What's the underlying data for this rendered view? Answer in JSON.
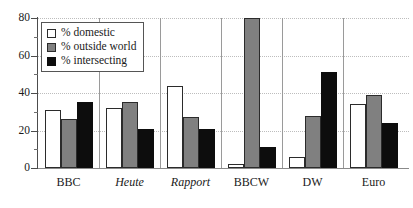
{
  "chart_data": {
    "type": "bar",
    "title": "",
    "xlabel": "",
    "ylabel": "",
    "ylim": [
      0,
      80
    ],
    "yticks": [
      0,
      20,
      40,
      60,
      80
    ],
    "ytick_labels": [
      "0",
      "20",
      "40",
      "60",
      "80"
    ],
    "minor_yticks": [
      10,
      30,
      50,
      70
    ],
    "grid": true,
    "grid_axis": "y",
    "grid_style": "dotted",
    "legend_position": "upper-left",
    "categories": [
      "BBC",
      "Heute",
      "Rapport",
      "BBCW",
      "DW",
      "Euro"
    ],
    "category_styles": [
      "normal",
      "italic",
      "italic",
      "normal",
      "normal",
      "normal"
    ],
    "series": [
      {
        "name": "% domestic",
        "color": "#ffffff",
        "edge_color": "#2b2b2b",
        "values": [
          31,
          32,
          44,
          2,
          6,
          34
        ]
      },
      {
        "name": "% outside world",
        "color": "#808080",
        "edge_color": "#2b2b2b",
        "values": [
          26,
          35,
          27,
          80,
          28,
          39
        ]
      },
      {
        "name": "% intersecting",
        "color": "#0d0d0d",
        "edge_color": "#0d0d0d",
        "values": [
          35,
          21,
          21,
          11,
          51,
          24
        ]
      }
    ]
  },
  "legend": {
    "items": [
      {
        "label": "% domestic",
        "swatch": "white-square-swatch"
      },
      {
        "label": "% outside world",
        "swatch": "gray-square-swatch"
      },
      {
        "label": "% intersecting",
        "swatch": "black-square-swatch"
      }
    ]
  },
  "axes": {
    "y_tick_labels": [
      "80",
      "60",
      "40",
      "20",
      "0"
    ]
  }
}
